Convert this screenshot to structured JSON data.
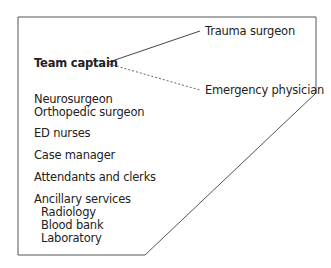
{
  "diagram": {
    "leader": "Team captain",
    "leader_links": [
      {
        "label": "Trauma surgeon",
        "style": "solid"
      },
      {
        "label": "Emergency physician",
        "style": "dashed"
      }
    ],
    "members": [
      "Neurosurgeon",
      "Orthopedic surgeon",
      "ED nurses",
      "Case manager",
      "Attendants and clerks",
      "Ancillary services"
    ],
    "ancillary_services": [
      "Radiology",
      "Blood bank",
      "Laboratory"
    ],
    "colors": {
      "line": "#555555",
      "text": "#222222"
    }
  }
}
